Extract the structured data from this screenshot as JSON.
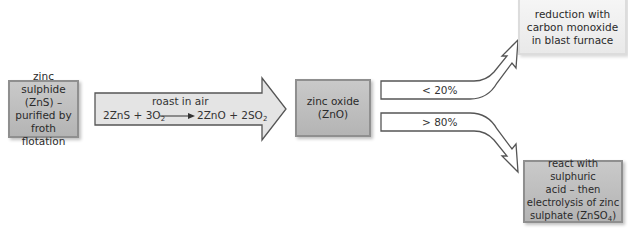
{
  "diagram": {
    "start_box": {
      "text": "zinc sulphide (ZnS) – purified by froth flotation",
      "lines": [
        "zinc sulphide",
        "(ZnS) –",
        "purified by",
        "froth flotation"
      ]
    },
    "roast_arrow": {
      "label": "roast in air",
      "equation_left": "2ZnS + 3O",
      "equation_left_sub": "2",
      "equation_right": "2ZnO + 2SO",
      "equation_right_sub": "2"
    },
    "middle_box": {
      "lines": [
        "zinc oxide",
        "(ZnO)"
      ]
    },
    "upper_branch": {
      "label": "< 20%"
    },
    "lower_branch": {
      "label": "> 80%"
    },
    "upper_box": {
      "lines": [
        "reduction with",
        "carbon monoxide",
        "in blast furnace"
      ]
    },
    "lower_box": {
      "lines": [
        "react with sulphuric",
        "acid – then",
        "electrolysis of zinc",
        "sulphate (ZnSO"
      ],
      "sub": "4",
      "tail": ")"
    },
    "colors": {
      "box_fill": "#bdbdbd",
      "box_border": "#8f8f8f",
      "light_fill": "#efefef",
      "arrow_fill": "#e2e2e2",
      "arrow_stroke": "#555555"
    }
  }
}
